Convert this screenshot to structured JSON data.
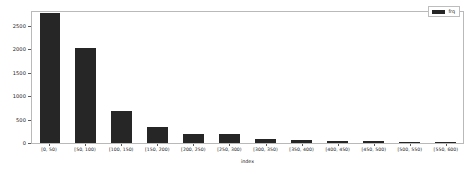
{
  "chart_data": {
    "type": "bar",
    "title": "",
    "xlabel": "index",
    "ylabel": "",
    "ylim": [
      0,
      2800
    ],
    "yticks": [
      0,
      500,
      1000,
      1500,
      2000,
      2500
    ],
    "ytick_labels": [
      "0",
      "500",
      "1000",
      "1500",
      "2000",
      "2500"
    ],
    "grid": false,
    "legend_position": "top-right",
    "legend": [
      "frq"
    ],
    "categories": [
      "[0, 50)",
      "[50, 100)",
      "[100, 150)",
      "[150, 200)",
      "[200, 250)",
      "[250, 300)",
      "[300, 350)",
      "[350, 400)",
      "[400, 450)",
      "[450, 500)",
      "[500, 550)",
      "[550, 600)"
    ],
    "series": [
      {
        "name": "frq",
        "color": "#262626",
        "values": [
          2780,
          2040,
          690,
          340,
          200,
          190,
          90,
          70,
          45,
          40,
          30,
          25
        ]
      }
    ]
  },
  "legend": {
    "label": "frq"
  },
  "axes": {
    "xlabel": "index"
  }
}
